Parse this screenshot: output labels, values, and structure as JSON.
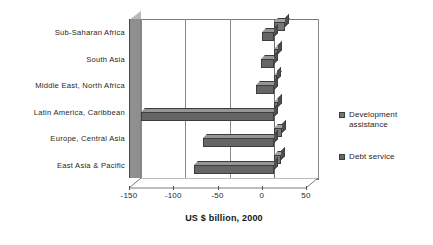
{
  "chart_data": {
    "type": "bar",
    "orientation": "horizontal",
    "title": "Resource flows",
    "categories": [
      "Sub-Saharan Africa",
      "South Asia",
      "Middle East, North Africa",
      "Latin America, Caribbean",
      "Europe, Central Asia",
      "East Asia & Pacific"
    ],
    "series": [
      {
        "name": "Development assistance",
        "color": "#757575",
        "values": [
          13,
          5,
          4,
          5,
          9,
          8
        ]
      },
      {
        "name": "Debt service",
        "color": "#666666",
        "values": [
          -13,
          -14,
          -20,
          -150,
          -80,
          -90
        ]
      }
    ],
    "xlabel": "US $ billion, 2000",
    "ylabel": "",
    "xlim": [
      -150,
      50
    ],
    "xticks": [
      -150,
      -100,
      -50,
      0,
      50
    ],
    "xtick_labels": [
      "-150",
      "-100",
      "-50",
      "0",
      "50"
    ],
    "grid": true,
    "legend_position": "right",
    "style_3d": true
  },
  "legend": {
    "entries": [
      {
        "label": "Development assistance",
        "color": "#757575"
      },
      {
        "label": "Debt service",
        "color": "#666666"
      }
    ]
  }
}
